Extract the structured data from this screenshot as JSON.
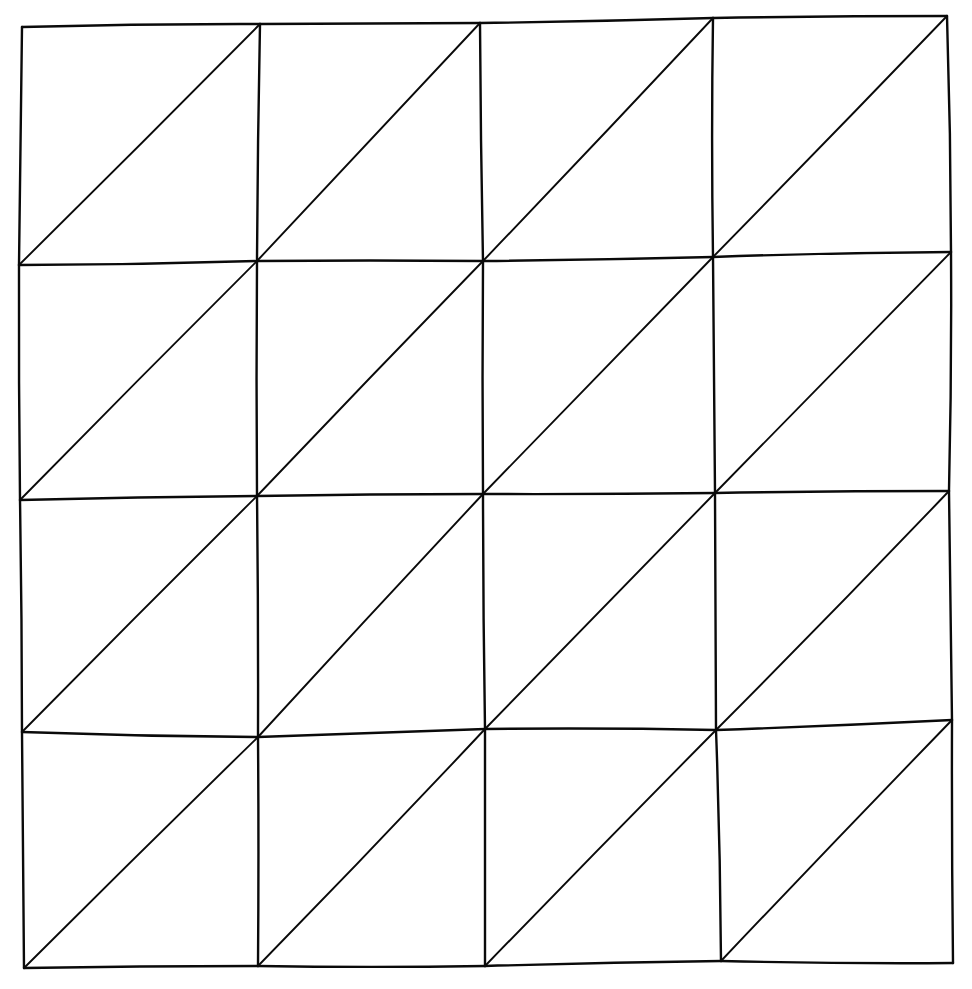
{
  "diagram": {
    "type": "triangulated-grid",
    "rows": 4,
    "cols": 4,
    "stroke_color": "#0a0a0a",
    "background": "#ffffff",
    "style": "hand-drawn",
    "diagonal_direction": "bottom-left to top-right",
    "nodes": [
      [
        [
          22,
          27
        ],
        [
          260,
          24
        ],
        [
          480,
          23
        ],
        [
          713,
          18
        ],
        [
          947,
          16
        ]
      ],
      [
        [
          19,
          265
        ],
        [
          257,
          261
        ],
        [
          483,
          261
        ],
        [
          713,
          257
        ],
        [
          951,
          252
        ]
      ],
      [
        [
          20,
          500
        ],
        [
          257,
          496
        ],
        [
          483,
          494
        ],
        [
          715,
          493
        ],
        [
          949,
          491
        ]
      ],
      [
        [
          22,
          732
        ],
        [
          258,
          737
        ],
        [
          485,
          729
        ],
        [
          716,
          730
        ],
        [
          952,
          720
        ]
      ],
      [
        [
          24,
          968
        ],
        [
          258,
          966
        ],
        [
          485,
          966
        ],
        [
          721,
          961
        ],
        [
          953,
          963
        ]
      ]
    ]
  }
}
